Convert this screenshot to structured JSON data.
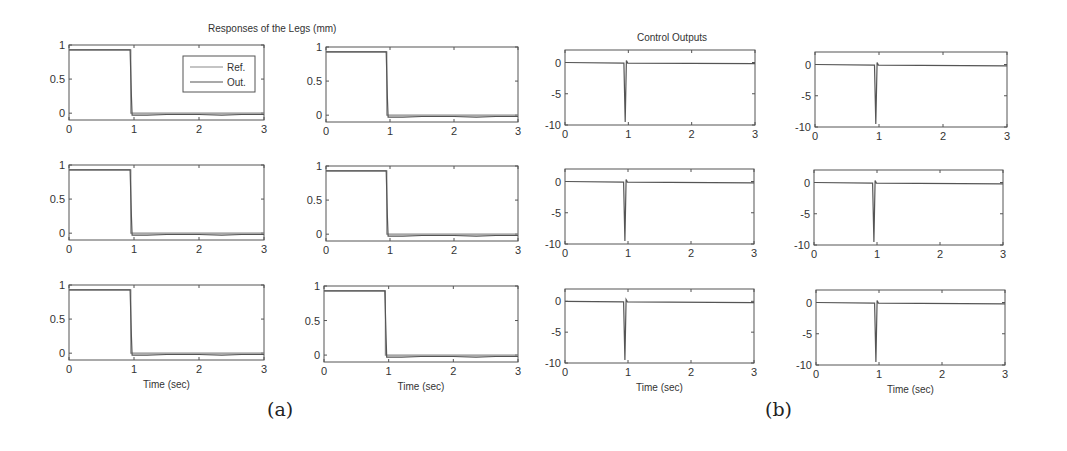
{
  "figure": {
    "group_a": {
      "title": "Responses of the Legs (mm)",
      "caption": "(a)"
    },
    "group_b": {
      "title": "Control Outputs",
      "caption": "(b)"
    },
    "xlabel": "Time (sec)",
    "legend": [
      "Ref.",
      "Out."
    ]
  },
  "colors": {
    "axes": "#555555",
    "line": "#555555",
    "ref": "#8a8a8a",
    "text": "#333333"
  },
  "chart_data": [
    {
      "id": "a",
      "type": "line",
      "title": "Responses of the Legs (mm)",
      "layout": "3x2 grid of subplots",
      "xlabel": "Time (sec)",
      "ylabel": "",
      "xlim": [
        0,
        3
      ],
      "ylim": [
        -0.1,
        1
      ],
      "xticks": [
        0,
        1,
        2,
        3
      ],
      "yticks": [
        0,
        0.5,
        1
      ],
      "ytick_labels": [
        "0",
        "0.5",
        "1"
      ],
      "grid": false,
      "legend": {
        "entries": [
          "Ref.",
          "Out."
        ],
        "position": "upper right (subplot 1 only)"
      },
      "series": [
        {
          "name": "Ref.",
          "x": [
            0,
            0.95,
            0.95,
            3
          ],
          "y": [
            0.93,
            0.93,
            0,
            0
          ]
        },
        {
          "name": "Out.",
          "x": [
            0,
            0.94,
            0.96,
            0.97,
            1.2,
            1.5,
            2.0,
            2.35,
            2.65,
            3
          ],
          "y": [
            0.93,
            0.93,
            0.25,
            -0.03,
            -0.03,
            -0.02,
            -0.02,
            -0.03,
            -0.02,
            -0.02
          ]
        }
      ]
    },
    {
      "id": "b",
      "type": "line",
      "title": "Control Outputs",
      "layout": "3x2 grid of subplots",
      "xlabel": "Time (sec)",
      "ylabel": "",
      "xlim": [
        0,
        3
      ],
      "ylim": [
        -10,
        2
      ],
      "xticks": [
        0,
        1,
        2,
        3
      ],
      "yticks": [
        -10,
        -5,
        0
      ],
      "ytick_labels": [
        "-10",
        "-5",
        "0"
      ],
      "grid": false,
      "series": [
        {
          "name": "Control",
          "x": [
            0,
            0.93,
            0.95,
            0.97,
            0.99,
            3
          ],
          "y": [
            0,
            -0.1,
            -9.5,
            0.3,
            -0.1,
            -0.2
          ]
        }
      ]
    }
  ],
  "subplots": [
    {
      "group": 0,
      "x": 69,
      "y": 45,
      "w": 195,
      "h": 75,
      "legend": true,
      "xlabel": false
    },
    {
      "group": 0,
      "x": 326,
      "y": 47,
      "w": 192,
      "h": 75,
      "legend": false,
      "xlabel": false
    },
    {
      "group": 0,
      "x": 69,
      "y": 165,
      "w": 195,
      "h": 75,
      "legend": false,
      "xlabel": false
    },
    {
      "group": 0,
      "x": 326,
      "y": 166,
      "w": 192,
      "h": 75,
      "legend": false,
      "xlabel": false
    },
    {
      "group": 0,
      "x": 69,
      "y": 285,
      "w": 195,
      "h": 75,
      "legend": false,
      "xlabel": true
    },
    {
      "group": 0,
      "x": 324,
      "y": 286,
      "w": 194,
      "h": 76,
      "legend": false,
      "xlabel": true
    },
    {
      "group": 1,
      "x": 565,
      "y": 50,
      "w": 190,
      "h": 75,
      "legend": false,
      "xlabel": false
    },
    {
      "group": 1,
      "x": 815,
      "y": 52,
      "w": 192,
      "h": 75,
      "legend": false,
      "xlabel": false
    },
    {
      "group": 1,
      "x": 565,
      "y": 169,
      "w": 189,
      "h": 75,
      "legend": false,
      "xlabel": false
    },
    {
      "group": 1,
      "x": 814,
      "y": 170,
      "w": 189,
      "h": 75,
      "legend": false,
      "xlabel": false
    },
    {
      "group": 1,
      "x": 565,
      "y": 289,
      "w": 189,
      "h": 74,
      "legend": false,
      "xlabel": true
    },
    {
      "group": 1,
      "x": 816,
      "y": 290,
      "w": 189,
      "h": 75,
      "legend": false,
      "xlabel": true
    }
  ]
}
